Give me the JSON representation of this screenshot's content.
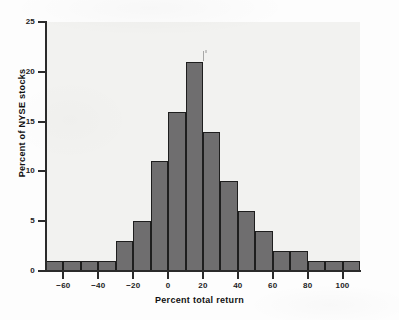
{
  "chart_data": {
    "type": "bar",
    "title": "",
    "subtitle": "",
    "xlabel": "Percent total return",
    "ylabel": "Percent of NYSE stocks",
    "xlim": [
      -70,
      110
    ],
    "ylim": [
      0,
      25
    ],
    "bin_width": 10,
    "grid": false,
    "legend": null,
    "bar_color": "#6f6e6f",
    "bar_edge_color": "#1e1e1e",
    "panel_color": "#f2f2f0",
    "axis_color": "#2b2b2b",
    "categories": [
      "-70 to -60",
      "-60 to -50",
      "-50 to -40",
      "-40 to -30",
      "-30 to -20",
      "-20 to -10",
      "-10 to 0",
      "0 to 10",
      "10 to 20",
      "20 to 30",
      "30 to 40",
      "40 to 50",
      "50 to 60",
      "60 to 70",
      "70 to 80",
      "80 to 90",
      "90 to 100",
      "100 to 110"
    ],
    "bin_starts": [
      -70,
      -60,
      -50,
      -40,
      -30,
      -20,
      -10,
      0,
      10,
      20,
      30,
      40,
      50,
      60,
      70,
      80,
      90,
      100
    ],
    "values": [
      1,
      1,
      1,
      1,
      3,
      5,
      11,
      16,
      21,
      14,
      9,
      6,
      4,
      2,
      2,
      1,
      1,
      1
    ],
    "xticks": [
      -60,
      -40,
      -20,
      0,
      20,
      40,
      60,
      80,
      100
    ],
    "xticklabels": [
      "−60",
      "−40",
      "−20",
      "0",
      "20",
      "40",
      "60",
      "80",
      "100"
    ],
    "yticks": [
      0,
      5,
      10,
      15,
      20,
      25
    ],
    "yticklabels": [
      "0",
      "5",
      "10",
      "15",
      "20",
      "25"
    ],
    "annotations": []
  }
}
